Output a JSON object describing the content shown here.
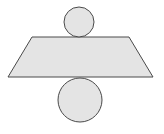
{
  "diagram": {
    "title": "",
    "colors": {
      "background": "#ffffff",
      "fill": "#e4e4e4",
      "stroke": "#4a4a4a"
    },
    "shapes": {
      "top_circle": {
        "cx": 79,
        "cy": 22,
        "r": 15
      },
      "trapezoid": {
        "points": "32,37 129,37 153,77 8,77"
      },
      "bottom_circle": {
        "cx": 80,
        "cy": 100,
        "r": 22
      }
    }
  }
}
